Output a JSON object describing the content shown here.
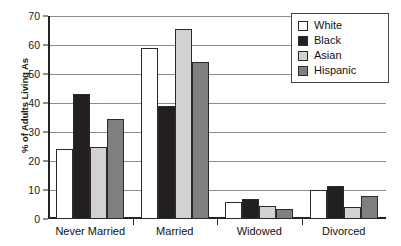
{
  "chart_data": {
    "type": "bar",
    "title": "",
    "xlabel": "",
    "ylabel": "% of Adults Living As",
    "ylim": [
      0,
      70
    ],
    "yticks": [
      0,
      10,
      20,
      30,
      40,
      50,
      60,
      70
    ],
    "grid": true,
    "legend_position": "top-right",
    "categories": [
      "Never Married",
      "Married",
      "Widowed",
      "Divorced"
    ],
    "series": [
      {
        "name": "White",
        "color": "#ffffff",
        "values": [
          24,
          59,
          6,
          10
        ]
      },
      {
        "name": "Black",
        "color": "#231f20",
        "values": [
          43,
          39,
          7,
          11.5
        ]
      },
      {
        "name": "Asian",
        "color": "#d2d2d2",
        "values": [
          25,
          65.5,
          4.5,
          4
        ]
      },
      {
        "name": "Hispanic",
        "color": "#7f7f7f",
        "values": [
          34.5,
          54,
          3.5,
          8
        ]
      }
    ]
  },
  "legend": {
    "items": [
      {
        "label": "White"
      },
      {
        "label": "Black"
      },
      {
        "label": "Asian"
      },
      {
        "label": "Hispanic"
      }
    ]
  },
  "axis": {
    "y_title": "% of Adults Living As"
  }
}
